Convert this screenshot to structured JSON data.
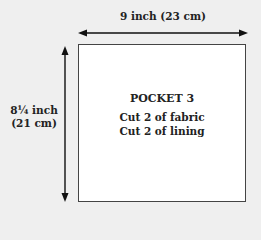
{
  "diagram": {
    "width_dimension": "9 inch (23 cm)",
    "height_dimension_line1": "8¼ inch",
    "height_dimension_line2": "(21 cm)",
    "piece": {
      "title": "POCKET 3",
      "instructions": [
        "Cut 2 of fabric",
        "Cut 2 of lining"
      ]
    }
  }
}
